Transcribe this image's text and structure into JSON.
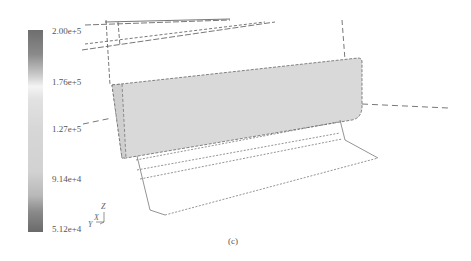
{
  "colorbar": {
    "ticks": [
      "2.00e+5",
      "1.76e+5",
      "1.27e+5",
      "9.14e+4",
      "5.12e+4"
    ],
    "max": "2.00e+5",
    "min": "5.12e+4",
    "color_top": "#6e6e6e",
    "color_mid": "#f4f4f4",
    "color_bottom": "#6a6a6a"
  },
  "axis_triad": {
    "z_label": "Z",
    "x_label": "X",
    "y_label": "Y"
  },
  "caption": "(c)"
}
